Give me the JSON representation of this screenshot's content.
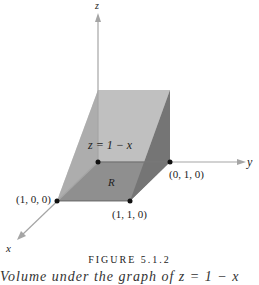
{
  "figure": {
    "axes": {
      "x_label": "x",
      "y_label": "y",
      "z_label": "z"
    },
    "surface_label": "z = 1 − x",
    "region_label": "R",
    "points": [
      {
        "id": "p100",
        "label": "(1, 0, 0)"
      },
      {
        "id": "p010",
        "label": "(0, 1, 0)"
      },
      {
        "id": "p110",
        "label": "(1, 1, 0)"
      }
    ],
    "colors": {
      "axis": "#aaaaaa",
      "slanted_face": "#b8b8b8",
      "end_face": "#7a7a7a",
      "region": "#8e8e8e",
      "point": "#111111"
    },
    "caption_title": "FIGURE 5.1.2",
    "caption_text": "Volume under the graph of z = 1 − x"
  }
}
